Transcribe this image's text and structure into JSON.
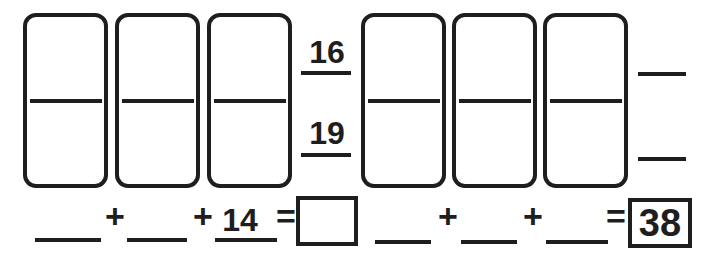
{
  "theme": {
    "paper": "#ffffff",
    "ink": "#1e1e1e"
  },
  "problem_left": {
    "top_sum": "16",
    "bottom_sum": "19",
    "equation": {
      "addend1": "",
      "plus1": "+",
      "addend2": "",
      "plus2": "+",
      "addend3": "14",
      "equals": "=",
      "answer": ""
    }
  },
  "problem_right": {
    "top_sum": "",
    "bottom_sum": "",
    "equation": {
      "addend1": "",
      "plus1": "+",
      "addend2": "",
      "plus2": "+",
      "addend3": "",
      "equals": "=",
      "answer": "38"
    }
  }
}
